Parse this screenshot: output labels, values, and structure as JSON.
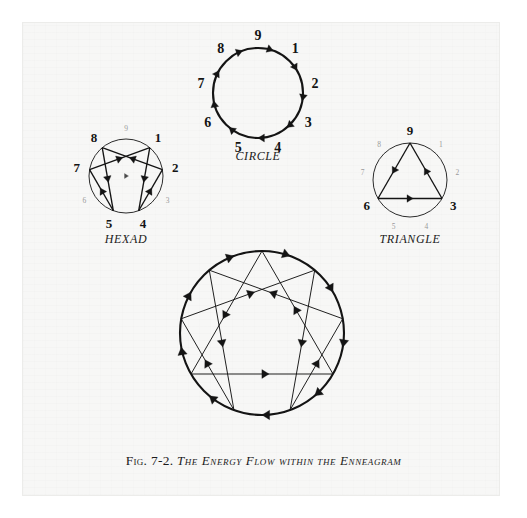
{
  "figure": {
    "caption_number": "Fig. 7-2.",
    "caption_text": "The Energy Flow within the Enneagram",
    "page_bg": "#f7f7f6",
    "ink": "#141414",
    "faint_ink": "#9a9a9a"
  },
  "panels": [
    {
      "id": "hexad",
      "label": "Hexad",
      "label_x": 126,
      "label_y": 243,
      "center": {
        "x": 126,
        "y": 176
      },
      "radius": 37,
      "circle_stroke_width": 0.9,
      "bold_points": [
        "8",
        "1",
        "7",
        "2",
        "5",
        "4"
      ],
      "faint_points": [
        "9",
        "6",
        "3"
      ],
      "path_order": [
        "1",
        "4",
        "2",
        "8",
        "5",
        "7"
      ],
      "numbers": [
        {
          "value": "9",
          "angle": -90,
          "strong": false
        },
        {
          "value": "1",
          "angle": -50,
          "strong": true
        },
        {
          "value": "2",
          "angle": -10,
          "strong": true
        },
        {
          "value": "3",
          "angle": 30,
          "strong": false
        },
        {
          "value": "4",
          "angle": 70,
          "strong": true
        },
        {
          "value": "5",
          "angle": 110,
          "strong": true
        },
        {
          "value": "6",
          "angle": 150,
          "strong": false
        },
        {
          "value": "7",
          "angle": 190,
          "strong": true
        },
        {
          "value": "8",
          "angle": 230,
          "strong": true
        }
      ]
    },
    {
      "id": "circle",
      "label": "Circle",
      "label_x": 258,
      "label_y": 160,
      "center": {
        "x": 258,
        "y": 93
      },
      "radius": 45,
      "circle_stroke_width": 2.1,
      "bold_points": [
        "1",
        "2",
        "3",
        "4",
        "5",
        "6",
        "7",
        "8",
        "9"
      ],
      "faint_points": [],
      "flow": "clockwise",
      "numbers": [
        {
          "value": "9",
          "angle": -90,
          "strong": true
        },
        {
          "value": "1",
          "angle": -50,
          "strong": true
        },
        {
          "value": "2",
          "angle": -10,
          "strong": true
        },
        {
          "value": "3",
          "angle": 30,
          "strong": true
        },
        {
          "value": "4",
          "angle": 70,
          "strong": true
        },
        {
          "value": "5",
          "angle": 110,
          "strong": true
        },
        {
          "value": "6",
          "angle": 150,
          "strong": true
        },
        {
          "value": "7",
          "angle": 190,
          "strong": true
        },
        {
          "value": "8",
          "angle": 230,
          "strong": true
        }
      ]
    },
    {
      "id": "triangle",
      "label": "Triangle",
      "label_x": 410,
      "label_y": 243,
      "center": {
        "x": 410,
        "y": 180
      },
      "radius": 37,
      "circle_stroke_width": 0.9,
      "bold_points": [
        "9",
        "6",
        "3"
      ],
      "faint_points": [
        "1",
        "2",
        "4",
        "5",
        "7",
        "8"
      ],
      "path_order": [
        "9",
        "6",
        "3"
      ],
      "numbers": [
        {
          "value": "9",
          "angle": -90,
          "strong": true
        },
        {
          "value": "1",
          "angle": -50,
          "strong": false
        },
        {
          "value": "2",
          "angle": -10,
          "strong": false
        },
        {
          "value": "3",
          "angle": 30,
          "strong": true
        },
        {
          "value": "4",
          "angle": 70,
          "strong": false
        },
        {
          "value": "5",
          "angle": 110,
          "strong": false
        },
        {
          "value": "6",
          "angle": 150,
          "strong": true
        },
        {
          "value": "7",
          "angle": 190,
          "strong": false
        },
        {
          "value": "8",
          "angle": 230,
          "strong": false
        }
      ]
    },
    {
      "id": "enneagram",
      "label": "",
      "center": {
        "x": 262,
        "y": 333
      },
      "radius": 82,
      "circle_stroke_width": 2.1,
      "hexad_order": [
        "1",
        "4",
        "2",
        "8",
        "5",
        "7"
      ],
      "triangle_order": [
        "9",
        "6",
        "3"
      ],
      "flow": "clockwise",
      "numbers": []
    }
  ],
  "chart_data": {
    "type": "diagram",
    "title": "The Energy Flow within the Enneagram",
    "point_angles_deg": {
      "9": -90,
      "1": -50,
      "2": -10,
      "3": 30,
      "4": 70,
      "5": 110,
      "6": 150,
      "7": 190,
      "8": 230
    },
    "sequences": {
      "circle_flow": [
        "9",
        "1",
        "2",
        "3",
        "4",
        "5",
        "6",
        "7",
        "8",
        "9"
      ],
      "hexad_flow": [
        "1",
        "4",
        "2",
        "8",
        "5",
        "7",
        "1"
      ],
      "triangle_flow": [
        "9",
        "6",
        "3",
        "9"
      ]
    }
  }
}
